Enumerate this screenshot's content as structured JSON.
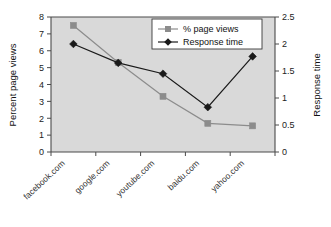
{
  "chart_data": {
    "type": "line",
    "title": "",
    "xlabel": "",
    "categories": [
      "facebook.com",
      "google.com",
      "youtube.com",
      "baidu.com",
      "yahoo.com"
    ],
    "series": [
      {
        "name": "% page views",
        "axis": "left",
        "marker": "square",
        "color": "#8c8c8c",
        "values": [
          7.5,
          5.3,
          3.3,
          1.7,
          1.55
        ]
      },
      {
        "name": "Response time",
        "axis": "right",
        "marker": "diamond",
        "color": "#1a1a1a",
        "values": [
          2.0,
          1.65,
          1.45,
          0.83,
          1.77
        ]
      }
    ],
    "left_axis": {
      "label": "Percent page views",
      "ylim": [
        0,
        8
      ],
      "ticks": [
        "0",
        "1",
        "2",
        "3",
        "4",
        "5",
        "6",
        "7",
        "8"
      ]
    },
    "right_axis": {
      "label": "Response time",
      "ylim": [
        0,
        2.5
      ],
      "ticks": [
        "0",
        "0.5",
        "1",
        "1.5",
        "2",
        "2.5"
      ]
    },
    "legend": {
      "position": "top-right-inside",
      "entries": [
        "% page views",
        "Response time"
      ]
    },
    "grid": false,
    "plot_background": "#d9d9d9",
    "figure_background": "#ffffff"
  }
}
